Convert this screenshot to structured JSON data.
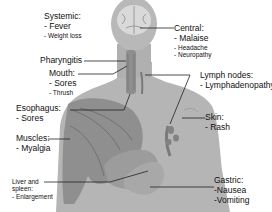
{
  "diagram": {
    "type": "anatomical-symptom-map",
    "colors": {
      "body_fill": "#b3b3b3",
      "body_shade": "#a6a6a6",
      "muscle": "#8c8c8c",
      "leader_line": "#222222",
      "text": "#111111"
    },
    "labels": {
      "systemic": {
        "title": "Systemic:",
        "items": [
          "- Fever",
          "- Weight loss"
        ]
      },
      "central": {
        "title": "Central:",
        "items": [
          "- Malaise",
          "- Headache",
          "- Neuropathy"
        ]
      },
      "pharyngitis": {
        "title": "Pharyngitis"
      },
      "mouth": {
        "title": "Mouth:",
        "items": [
          "- Sores",
          "- Thrush"
        ]
      },
      "lymph": {
        "title": "Lymph nodes:",
        "items": [
          "- Lymphadenopathy"
        ]
      },
      "esophagus": {
        "title": "Esophagus:",
        "items": [
          "- Sores"
        ]
      },
      "skin": {
        "title": "Skin:",
        "items": [
          "- Rash"
        ]
      },
      "muscles": {
        "title": "Muscles:",
        "items": [
          "- Myalgia"
        ]
      },
      "liver": {
        "title_line1": "Liver and",
        "title_line2": "spleen:",
        "items": [
          "- Enlargement"
        ]
      },
      "gastric": {
        "title": "Gastric:",
        "items": [
          "-Nausea",
          "-Vomiting"
        ]
      }
    }
  }
}
